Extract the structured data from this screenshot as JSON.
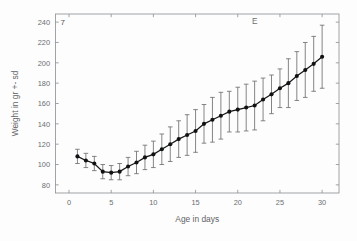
{
  "figure": {
    "panel_label": "E",
    "corner_label": "7",
    "background_color": "#fdfdfd",
    "marker_color": "#101214",
    "errorbar_color": "#6d7073",
    "axis_color": "#8a8d90",
    "text_color": "#6b6e71"
  },
  "chart_data": {
    "type": "line",
    "title": "",
    "subtitle": "",
    "xlabel": "Age in days",
    "ylabel": "Weight in gr +- sd",
    "xlim": [
      -1.6,
      32.0
    ],
    "ylim": [
      72,
      248
    ],
    "xticks": [
      0,
      5,
      10,
      15,
      20,
      25,
      30
    ],
    "xtick_labels": [
      "0",
      "5",
      "10",
      "15",
      "20",
      "25",
      "30"
    ],
    "yticks": [
      80,
      100,
      120,
      140,
      160,
      180,
      200,
      220,
      240
    ],
    "ytick_labels": [
      "80",
      "100",
      "120",
      "140",
      "160",
      "180",
      "200",
      "220",
      "240"
    ],
    "grid": false,
    "legend": null,
    "annotations": [
      {
        "text": "E",
        "x": 22.0,
        "y": 238
      },
      {
        "text": "7",
        "x": -1.0,
        "y": 237
      }
    ],
    "x": [
      1,
      2,
      3,
      4,
      5,
      6,
      7,
      8,
      9,
      10,
      11,
      12,
      13,
      14,
      15,
      16,
      17,
      18,
      19,
      20,
      21,
      22,
      23,
      24,
      25,
      26,
      27,
      28,
      29,
      30
    ],
    "series": [
      {
        "name": "Weight",
        "values": [
          108,
          104,
          101,
          93,
          92,
          93,
          98,
          102,
          107,
          110,
          115,
          120,
          125,
          129,
          133,
          140,
          144,
          148,
          152,
          154,
          156,
          158,
          164,
          169,
          175,
          180,
          187,
          193,
          199,
          206
        ],
        "errors": [
          7,
          7,
          7,
          7,
          7,
          8,
          9,
          11,
          12,
          13,
          15,
          17,
          18,
          20,
          21,
          19,
          22,
          23,
          20,
          22,
          23,
          24,
          21,
          19,
          19,
          24,
          24,
          27,
          27,
          31
        ]
      }
    ]
  }
}
